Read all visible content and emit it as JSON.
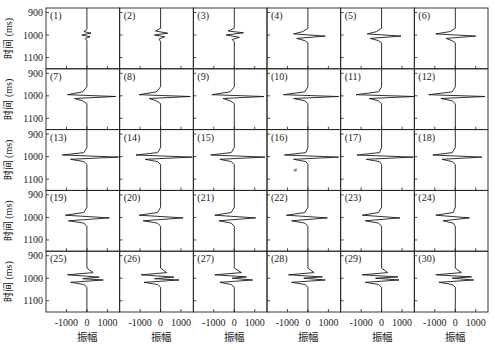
{
  "chart_data": {
    "type": "line",
    "layout": {
      "rows": 5,
      "cols": 6,
      "grid": false,
      "legend": "none"
    },
    "ylabel": "时间 (ms)",
    "xlabel": "振幅",
    "yticks": [
      900,
      1000,
      1100
    ],
    "xticks": [
      -1000,
      0,
      1000
    ],
    "xtick_labels": [
      "-1000",
      "0",
      "1000"
    ],
    "ylim": [
      880,
      1150
    ],
    "xlim": [
      -2000,
      1600
    ],
    "stray_mark": {
      "panel": 16,
      "text": "#"
    },
    "panels": [
      {
        "label": "(1)",
        "wavelet": [
          [
            975,
            0
          ],
          [
            985,
            -150
          ],
          [
            992,
            200
          ],
          [
            1000,
            -250
          ],
          [
            1008,
            150
          ],
          [
            1015,
            -80
          ],
          [
            1025,
            0
          ]
        ]
      },
      {
        "label": "(2)",
        "wavelet": [
          [
            970,
            0
          ],
          [
            982,
            -250
          ],
          [
            992,
            350
          ],
          [
            1000,
            -300
          ],
          [
            1008,
            200
          ],
          [
            1018,
            -80
          ],
          [
            1030,
            0
          ]
        ]
      },
      {
        "label": "(3)",
        "wavelet": [
          [
            970,
            0
          ],
          [
            982,
            -300
          ],
          [
            990,
            450
          ],
          [
            1000,
            -400
          ],
          [
            1010,
            250
          ],
          [
            1020,
            -100
          ],
          [
            1030,
            0
          ]
        ]
      },
      {
        "label": "(4)",
        "wavelet": [
          [
            970,
            0
          ],
          [
            985,
            -250
          ],
          [
            995,
            -700
          ],
          [
            1005,
            850
          ],
          [
            1015,
            -550
          ],
          [
            1025,
            -150
          ],
          [
            1035,
            0
          ]
        ]
      },
      {
        "label": "(5)",
        "wavelet": [
          [
            970,
            0
          ],
          [
            985,
            -250
          ],
          [
            995,
            -700
          ],
          [
            1005,
            950
          ],
          [
            1015,
            -550
          ],
          [
            1025,
            -150
          ],
          [
            1035,
            0
          ]
        ]
      },
      {
        "label": "(6)",
        "wavelet": [
          [
            970,
            0
          ],
          [
            985,
            -250
          ],
          [
            995,
            -950
          ],
          [
            1005,
            1000
          ],
          [
            1015,
            -450
          ],
          [
            1025,
            -150
          ],
          [
            1035,
            0
          ]
        ]
      },
      {
        "label": "(7)",
        "wavelet": [
          [
            960,
            0
          ],
          [
            982,
            -200
          ],
          [
            995,
            -950
          ],
          [
            1003,
            1400
          ],
          [
            1012,
            -600
          ],
          [
            1022,
            -200
          ],
          [
            1035,
            0
          ]
        ]
      },
      {
        "label": "(8)",
        "wavelet": [
          [
            960,
            0
          ],
          [
            982,
            -200
          ],
          [
            995,
            -1050
          ],
          [
            1003,
            1450
          ],
          [
            1012,
            -550
          ],
          [
            1022,
            -200
          ],
          [
            1035,
            0
          ]
        ]
      },
      {
        "label": "(9)",
        "wavelet": [
          [
            960,
            0
          ],
          [
            982,
            -200
          ],
          [
            995,
            -1100
          ],
          [
            1003,
            1450
          ],
          [
            1012,
            -550
          ],
          [
            1022,
            -200
          ],
          [
            1035,
            0
          ]
        ]
      },
      {
        "label": "(10)",
        "wavelet": [
          [
            960,
            0
          ],
          [
            982,
            -150
          ],
          [
            995,
            -1200
          ],
          [
            1003,
            1500
          ],
          [
            1012,
            -700
          ],
          [
            1022,
            -150
          ],
          [
            1035,
            0
          ]
        ]
      },
      {
        "label": "(11)",
        "wavelet": [
          [
            960,
            0
          ],
          [
            982,
            -150
          ],
          [
            995,
            -1250
          ],
          [
            1003,
            1600
          ],
          [
            1012,
            -600
          ],
          [
            1022,
            -150
          ],
          [
            1035,
            0
          ]
        ]
      },
      {
        "label": "(12)",
        "wavelet": [
          [
            960,
            0
          ],
          [
            982,
            -150
          ],
          [
            995,
            -1300
          ],
          [
            1003,
            1450
          ],
          [
            1012,
            -700
          ],
          [
            1022,
            -150
          ],
          [
            1035,
            0
          ]
        ]
      },
      {
        "label": "(13)",
        "wavelet": [
          [
            960,
            0
          ],
          [
            982,
            -150
          ],
          [
            993,
            -1200
          ],
          [
            1002,
            1550
          ],
          [
            1012,
            -800
          ],
          [
            1022,
            -150
          ],
          [
            1035,
            0
          ]
        ]
      },
      {
        "label": "(14)",
        "wavelet": [
          [
            960,
            0
          ],
          [
            982,
            -150
          ],
          [
            993,
            -1200
          ],
          [
            1002,
            1550
          ],
          [
            1012,
            -750
          ],
          [
            1022,
            -150
          ],
          [
            1035,
            0
          ]
        ]
      },
      {
        "label": "(15)",
        "wavelet": [
          [
            960,
            0
          ],
          [
            982,
            -150
          ],
          [
            993,
            -1150
          ],
          [
            1002,
            1500
          ],
          [
            1012,
            -700
          ],
          [
            1022,
            -150
          ],
          [
            1035,
            0
          ]
        ]
      },
      {
        "label": "(16)",
        "wavelet": [
          [
            960,
            0
          ],
          [
            982,
            -100
          ],
          [
            993,
            -1150
          ],
          [
            1002,
            1500
          ],
          [
            1012,
            -700
          ],
          [
            1022,
            -100
          ],
          [
            1035,
            0
          ]
        ]
      },
      {
        "label": "(17)",
        "wavelet": [
          [
            960,
            0
          ],
          [
            982,
            -100
          ],
          [
            993,
            -1200
          ],
          [
            1002,
            1550
          ],
          [
            1012,
            -750
          ],
          [
            1022,
            -100
          ],
          [
            1035,
            0
          ]
        ]
      },
      {
        "label": "(18)",
        "wavelet": [
          [
            960,
            0
          ],
          [
            982,
            -150
          ],
          [
            993,
            -1100
          ],
          [
            1002,
            1300
          ],
          [
            1012,
            -650
          ],
          [
            1022,
            -150
          ],
          [
            1035,
            0
          ]
        ]
      },
      {
        "label": "(19)",
        "wavelet": [
          [
            955,
            0
          ],
          [
            978,
            -150
          ],
          [
            990,
            -1050
          ],
          [
            1002,
            1100
          ],
          [
            1015,
            -900
          ],
          [
            1025,
            -150
          ],
          [
            1040,
            0
          ]
        ]
      },
      {
        "label": "(20)",
        "wavelet": [
          [
            955,
            0
          ],
          [
            978,
            -150
          ],
          [
            990,
            -1050
          ],
          [
            1002,
            1100
          ],
          [
            1015,
            -850
          ],
          [
            1025,
            -150
          ],
          [
            1040,
            0
          ]
        ]
      },
      {
        "label": "(21)",
        "wavelet": [
          [
            955,
            0
          ],
          [
            978,
            -150
          ],
          [
            990,
            -950
          ],
          [
            1002,
            1050
          ],
          [
            1015,
            -750
          ],
          [
            1025,
            -150
          ],
          [
            1040,
            0
          ]
        ]
      },
      {
        "label": "(22)",
        "wavelet": [
          [
            955,
            0
          ],
          [
            978,
            -150
          ],
          [
            990,
            -1050
          ],
          [
            1002,
            950
          ],
          [
            1015,
            -800
          ],
          [
            1025,
            -150
          ],
          [
            1040,
            0
          ]
        ]
      },
      {
        "label": "(23)",
        "wavelet": [
          [
            955,
            0
          ],
          [
            978,
            -150
          ],
          [
            990,
            -950
          ],
          [
            1002,
            900
          ],
          [
            1015,
            -800
          ],
          [
            1025,
            -150
          ],
          [
            1040,
            0
          ]
        ]
      },
      {
        "label": "(24)",
        "wavelet": [
          [
            955,
            0
          ],
          [
            978,
            -100
          ],
          [
            990,
            -950
          ],
          [
            1002,
            700
          ],
          [
            1015,
            -600
          ],
          [
            1025,
            -100
          ],
          [
            1040,
            0
          ]
        ]
      },
      {
        "label": "(25)",
        "wavelet": [
          [
            955,
            0
          ],
          [
            975,
            300
          ],
          [
            985,
            -950
          ],
          [
            995,
            600
          ],
          [
            1002,
            -200
          ],
          [
            1008,
            800
          ],
          [
            1018,
            -800
          ],
          [
            1028,
            -150
          ],
          [
            1040,
            0
          ]
        ]
      },
      {
        "label": "(26)",
        "wavelet": [
          [
            955,
            0
          ],
          [
            975,
            300
          ],
          [
            985,
            -950
          ],
          [
            995,
            650
          ],
          [
            1002,
            -300
          ],
          [
            1008,
            900
          ],
          [
            1018,
            -800
          ],
          [
            1028,
            -150
          ],
          [
            1040,
            0
          ]
        ]
      },
      {
        "label": "(27)",
        "wavelet": [
          [
            955,
            0
          ],
          [
            975,
            350
          ],
          [
            985,
            -950
          ],
          [
            994,
            600
          ],
          [
            1000,
            -100
          ],
          [
            1008,
            900
          ],
          [
            1018,
            -700
          ],
          [
            1028,
            -150
          ],
          [
            1040,
            0
          ]
        ]
      },
      {
        "label": "(28)",
        "wavelet": [
          [
            955,
            0
          ],
          [
            975,
            300
          ],
          [
            985,
            -950
          ],
          [
            994,
            700
          ],
          [
            1000,
            -200
          ],
          [
            1008,
            850
          ],
          [
            1018,
            -800
          ],
          [
            1028,
            -150
          ],
          [
            1040,
            0
          ]
        ]
      },
      {
        "label": "(29)",
        "wavelet": [
          [
            955,
            0
          ],
          [
            975,
            300
          ],
          [
            985,
            -950
          ],
          [
            994,
            800
          ],
          [
            1000,
            -300
          ],
          [
            1008,
            850
          ],
          [
            1018,
            -800
          ],
          [
            1028,
            -150
          ],
          [
            1040,
            0
          ]
        ]
      },
      {
        "label": "(30)",
        "wavelet": [
          [
            955,
            0
          ],
          [
            975,
            300
          ],
          [
            985,
            -950
          ],
          [
            994,
            800
          ],
          [
            1000,
            -150
          ],
          [
            1008,
            900
          ],
          [
            1018,
            -800
          ],
          [
            1028,
            -150
          ],
          [
            1040,
            0
          ]
        ]
      }
    ]
  },
  "axes": {
    "ylabel": "时间 (ms)",
    "xlabel": "振幅",
    "ytick_labels": [
      "900",
      "1000",
      "1100"
    ],
    "xtick_labels": [
      "-1000",
      "0",
      "1000"
    ]
  },
  "colors": {
    "line": "#1a1a1a",
    "frame": "#222222",
    "background": "#ffffff"
  }
}
